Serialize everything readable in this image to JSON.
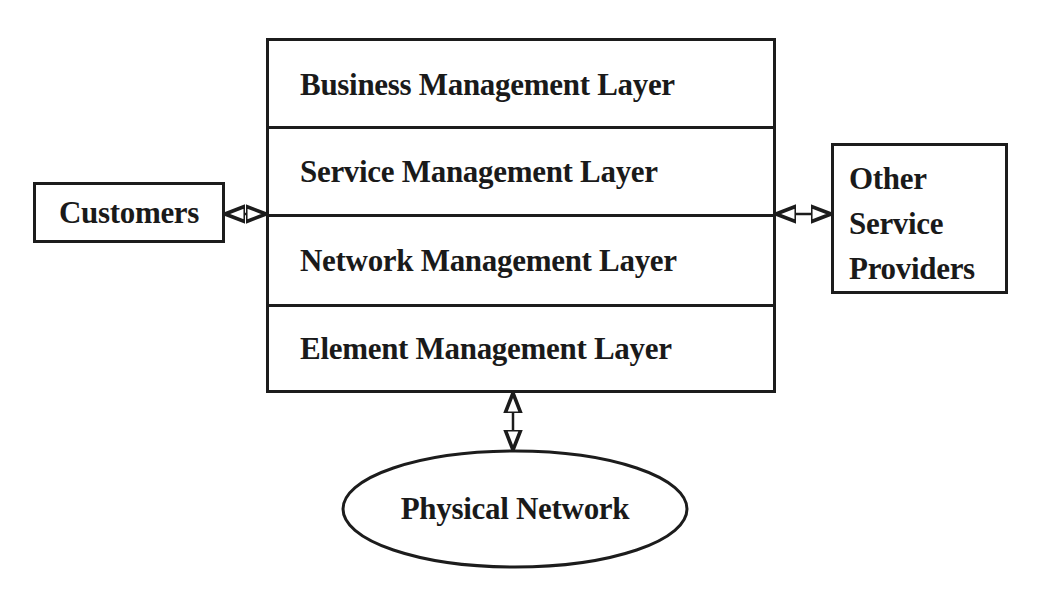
{
  "diagram": {
    "type": "layered-architecture",
    "layers_stack": {
      "layers": [
        {
          "label": "Business Management Layer"
        },
        {
          "label": "Service Management Layer"
        },
        {
          "label": "Network Management Layer"
        },
        {
          "label": "Element Management Layer"
        }
      ]
    },
    "external_entities": {
      "left": {
        "label": "Customers"
      },
      "right": {
        "lines": [
          "Other",
          "Service",
          "Providers"
        ]
      },
      "bottom": {
        "label": "Physical Network",
        "shape": "ellipse"
      }
    },
    "connections": [
      {
        "from": "Customers",
        "to": "Service/Network layer boundary",
        "style": "bidirectional-arrow"
      },
      {
        "from": "Service/Network layer boundary",
        "to": "Other Service Providers",
        "style": "bidirectional-arrow"
      },
      {
        "from": "Element Management Layer",
        "to": "Physical Network",
        "style": "bidirectional-arrow"
      }
    ],
    "colors": {
      "stroke": "#1c1c1c",
      "text": "#1a1a1a",
      "background": "#ffffff"
    }
  }
}
